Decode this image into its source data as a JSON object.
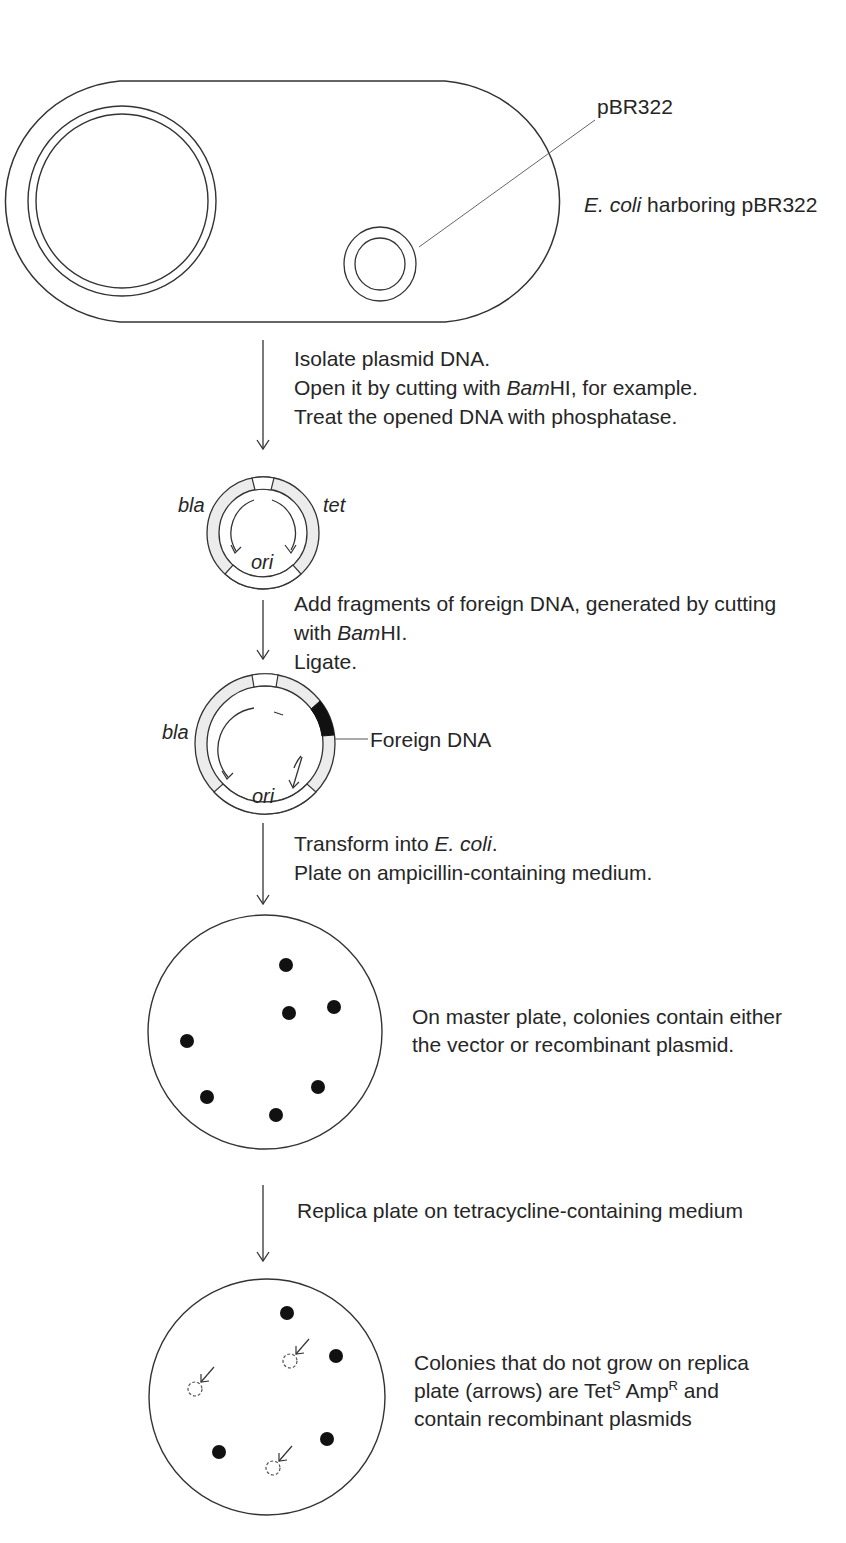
{
  "cell": {
    "plasmid_label": "pBR322",
    "caption_italic": "E. coli",
    "caption_rest": " harboring pBR322"
  },
  "step1": {
    "line1": "Isolate plasmid DNA.",
    "line2_pre": "Open it by cutting with ",
    "line2_italic": "Bam",
    "line2_post": "HI, for example.",
    "line3": "Treat the opened DNA with phosphatase."
  },
  "plasmid_open": {
    "label_left": "bla",
    "label_right": "tet",
    "label_bottom": "ori"
  },
  "step2": {
    "line1": "Add fragments of foreign DNA, generated by cutting",
    "line2_pre": "with ",
    "line2_italic": "Bam",
    "line2_post": "HI.",
    "line3": "Ligate."
  },
  "plasmid_recombinant": {
    "label_left": "bla",
    "label_bottom": "ori",
    "insert_label": "Foreign DNA"
  },
  "step3": {
    "line1_pre": "Transform into ",
    "line1_italic": "E. coli",
    "line1_post": ".",
    "line2": "Plate on ampicillin-containing medium."
  },
  "master_plate": {
    "caption_line1": "On master plate, colonies contain either",
    "caption_line2": "the vector or recombinant plasmid.",
    "colonies": [
      [
        286,
        965
      ],
      [
        289,
        1013
      ],
      [
        334,
        1007
      ],
      [
        187,
        1041
      ],
      [
        207,
        1097
      ],
      [
        318,
        1087
      ],
      [
        276,
        1115
      ]
    ]
  },
  "step4": {
    "line1": "Replica plate on tetracycline-containing medium"
  },
  "replica_plate": {
    "caption_line1": "Colonies that do not grow on replica",
    "caption_line2_pre": "plate (arrows) are Tet",
    "sup_s": "S",
    "caption_line2_mid": " Amp",
    "sup_r": "R",
    "caption_line2_post": " and",
    "caption_line3": "contain recombinant plasmids",
    "colonies": [
      [
        287,
        1313
      ],
      [
        336,
        1356
      ],
      [
        219,
        1452
      ],
      [
        327,
        1439
      ]
    ],
    "missing_colonies": [
      [
        290,
        1361
      ],
      [
        195,
        1389
      ],
      [
        273,
        1468
      ]
    ]
  }
}
